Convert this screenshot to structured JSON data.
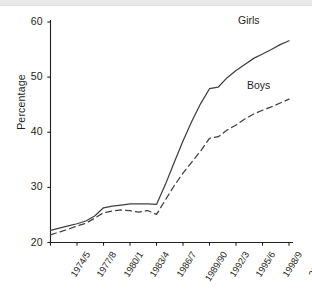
{
  "chart_data": {
    "type": "line",
    "title": "",
    "xlabel": "",
    "ylabel": "Percentage",
    "ylim": [
      20,
      60
    ],
    "yticks": [
      20,
      30,
      40,
      50,
      60
    ],
    "grid": false,
    "legend_position": "inline-right",
    "categories": [
      "1974/5",
      "1975/6",
      "1976/7",
      "1977/8",
      "1978/9",
      "1979/80",
      "1980/1",
      "1981/2",
      "1982/3",
      "1983/4",
      "1984/5",
      "1985/6",
      "1986/7",
      "1987/8",
      "1988/9",
      "1989/90",
      "1990/1",
      "1991/2",
      "1992/3",
      "1993/4",
      "1994/5",
      "1995/6",
      "1996/7",
      "1997/8",
      "1998/9",
      "1999/00",
      "2000/1",
      "2001/2"
    ],
    "xtick_labels": [
      "1974/5",
      "1977/8",
      "1980/1",
      "1983/4",
      "1986/7",
      "1989/90",
      "1992/3",
      "1995/6",
      "1998/9",
      "2001/2"
    ],
    "series": [
      {
        "name": "Girls",
        "style": "solid",
        "color": "#3f3f3f",
        "values": [
          22.2,
          22.6,
          23.0,
          23.4,
          23.9,
          24.8,
          26.3,
          26.6,
          26.8,
          27.0,
          27.0,
          27.0,
          26.9,
          30.5,
          34.5,
          38.4,
          42.0,
          45.2,
          47.9,
          48.2,
          49.9,
          51.2,
          52.3,
          53.4,
          54.2,
          55.0,
          55.9,
          56.6
        ]
      },
      {
        "name": "Boys",
        "style": "dashed",
        "color": "#3f3f3f",
        "values": [
          21.4,
          21.9,
          22.4,
          23.0,
          23.5,
          24.4,
          25.4,
          25.7,
          25.9,
          25.8,
          25.5,
          25.8,
          25.1,
          27.7,
          30.3,
          32.6,
          34.6,
          36.6,
          38.9,
          39.2,
          40.4,
          41.3,
          42.4,
          43.3,
          44.0,
          44.6,
          45.3,
          46.0
        ]
      }
    ],
    "annotations": [
      {
        "text": "Girls",
        "series": "Girls"
      },
      {
        "text": "Boys",
        "series": "Boys"
      }
    ]
  }
}
